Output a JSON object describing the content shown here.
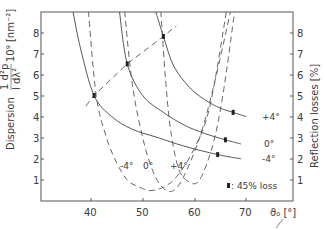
{
  "chart_data": {
    "type": "line",
    "title": "",
    "xlabel": "ϑ0 [°]",
    "ylabel_left": "Dispersion  (1/d)(d²p/dλ²)·10⁹ [nm⁻²]",
    "ylabel_right": "Reflection losses [%]",
    "xlim": [
      32,
      76
    ],
    "ylim_left": [
      0,
      9
    ],
    "ylim_right": [
      0,
      9
    ],
    "x_ticks": [
      40,
      50,
      60,
      70
    ],
    "y_ticks_left": [
      1,
      2,
      3,
      4,
      5,
      6,
      7,
      8
    ],
    "y_ticks_right": [
      1,
      2,
      3,
      4,
      5,
      6,
      7,
      8
    ],
    "grid": false,
    "legend": {
      "marker": "▮",
      "text": ": 45% loss",
      "position": "lower right"
    },
    "series": [
      {
        "name": "-4°",
        "kind": "dispersion",
        "style": "solid",
        "x": [
          36.5,
          38,
          40.6,
          44,
          48,
          53,
          58,
          64.5,
          69
        ],
        "y": [
          9.0,
          7.2,
          5.0,
          4.0,
          3.4,
          3.0,
          2.6,
          2.2,
          2.0
        ]
      },
      {
        "name": "0°",
        "kind": "dispersion",
        "style": "solid",
        "x": [
          45.5,
          47,
          50,
          54,
          58,
          62,
          66,
          69
        ],
        "y": [
          9.0,
          6.5,
          5.0,
          4.2,
          3.6,
          3.2,
          2.9,
          2.7
        ]
      },
      {
        "name": "+4°",
        "kind": "dispersion",
        "style": "solid",
        "x": [
          52.5,
          54,
          56,
          59,
          62,
          65,
          67.5,
          70
        ],
        "y": [
          9.0,
          7.8,
          6.4,
          5.4,
          4.8,
          4.4,
          4.2,
          4.0
        ]
      },
      {
        "name": "-4°",
        "kind": "reflection",
        "style": "dashed",
        "x": [
          39.5,
          41,
          43,
          45,
          47,
          49,
          52,
          56,
          60,
          63,
          66.2
        ],
        "y": [
          9.0,
          5.0,
          3.0,
          1.8,
          1.0,
          0.7,
          0.5,
          1.0,
          2.5,
          4.5,
          9.0
        ]
      },
      {
        "name": "0°",
        "kind": "reflection",
        "style": "dashed",
        "x": [
          46.5,
          48,
          50,
          52,
          54,
          56,
          58,
          61,
          63.8,
          67
        ],
        "y": [
          9.0,
          5.5,
          3.0,
          1.4,
          0.6,
          0.5,
          1.2,
          3.0,
          5.5,
          9.0
        ]
      },
      {
        "name": "+4°",
        "kind": "reflection",
        "style": "dashed",
        "x": [
          53.5,
          54.5,
          55.5,
          57,
          59,
          61,
          63.5,
          65.5,
          67.8
        ],
        "y": [
          9.0,
          5.5,
          3.2,
          1.5,
          0.9,
          1.0,
          2.6,
          5.0,
          9.0
        ]
      },
      {
        "name": "45% loss locus",
        "kind": "locus",
        "style": "dashed",
        "x": [
          39,
          40.6,
          47,
          54,
          56.5
        ],
        "y": [
          4.5,
          5.0,
          6.5,
          7.8,
          8.3
        ]
      }
    ],
    "annotations": [
      {
        "text": "+4°",
        "x": 70,
        "y": 4.0
      },
      {
        "text": "0°",
        "x": 70,
        "y": 2.7
      },
      {
        "text": "-4°",
        "x": 70,
        "y": 2.0
      },
      {
        "text": "-4°",
        "x": 47,
        "y": 1.7
      },
      {
        "text": "0°",
        "x": 51,
        "y": 1.7
      },
      {
        "text": "+4°",
        "x": 55.5,
        "y": 1.7
      }
    ]
  },
  "labels": {
    "y_left_title_1": "Dispersion",
    "y_left_title_2": "1   d²p",
    "y_left_title_3": "l   dλ²",
    "y_left_unit": "10⁹ [nm⁻²]",
    "y_right_title": "Reflection  losses [%]",
    "x_title": "ϑ₀ [°]",
    "legend_text": ": 45% loss",
    "curve_plus4_right": "+4°",
    "curve_0_right": "0°",
    "curve_minus4_right": "-4°",
    "curve_minus4_bottom": "-4°",
    "curve_0_bottom": "0°",
    "curve_plus4_bottom": "+4°",
    "xt_40": "40",
    "xt_50": "50",
    "xt_60": "60",
    "xt_70": "70",
    "yl_1": "1",
    "yl_2": "2",
    "yl_3": "3",
    "yl_4": "4",
    "yl_5": "5",
    "yl_6": "6",
    "yl_7": "7",
    "yl_8": "8",
    "yr_1": "1",
    "yr_2": "2",
    "yr_3": "3",
    "yr_4": "4",
    "yr_5": "5",
    "yr_6": "6",
    "yr_7": "7",
    "yr_8": "8"
  }
}
